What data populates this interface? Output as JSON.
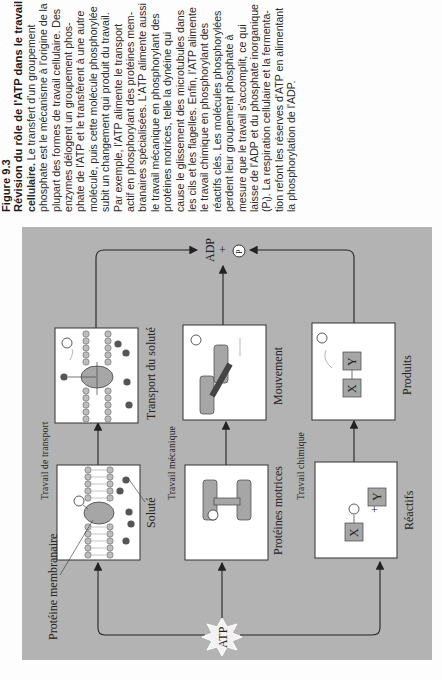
{
  "figure": {
    "number": "Figure 9.3",
    "title_lines": [
      "Révision du rôle de l'ATP dans le travail",
      "cellulaire."
    ],
    "caption_lines": [
      "Figure 9.3",
      "Révision du rôle de l'ATP dans le travail",
      "cellulaire. Le transfert d'un groupement",
      "phosphate est le mécanisme à l'origine de la",
      "plupart des formes de travail cellulaire. Des",
      "enzymes délogent un groupement phos-",
      "phate de l'ATP et le transfèrent à une autre",
      "molécule, puis cette molécule phosphorylée",
      "subit un changement qui produit du travail.",
      "Par exemple, l'ATP alimente le transport",
      "actif en phosphorylant des protéines mem-",
      "branaires spécialisées. L'ATP alimente aussi",
      "le travail mécanique en phosphorylant des",
      "protéines motrices, telle la dynéine qui",
      "cause le glissement des microtubules dans",
      "les cils et les flagelles. Enfin, l'ATP alimente",
      "le travail chimique en phosphorylant des",
      "réactifs clés. Les molécules phosphorylées",
      "perdent leur groupement phosphate à",
      "mesure que le travail s'accomplit, ce qui",
      "laisse de l'ADP et du phosphate inorganique",
      "(Pᵢ). La respiration cellulaire et la fermenta-",
      "tion refont les réserves d'ATP en alimentant",
      "la phosphorylation de l'ADP."
    ]
  },
  "diagram": {
    "colors": {
      "panel": "#b3b3b3",
      "box": "#ffffff",
      "protein": "#a6a6a6",
      "solute": "#555555",
      "lipid": "#bdbdbd"
    },
    "start": "ATP",
    "end": {
      "adp": "ADP",
      "plus": "+",
      "pi": "P",
      "pi_sub": "i"
    },
    "rows": [
      {
        "header": "Travail de transport",
        "before": {
          "label": "",
          "callouts": [
            "Protéine membranaire",
            "Soluté"
          ],
          "phosphate": "P"
        },
        "after": {
          "label": "Transport du soluté",
          "phosphate": "P",
          "phosphate_sub": "i"
        }
      },
      {
        "header": "Travail mécanique",
        "before": {
          "label": "Protéines motrices",
          "phosphate": "P"
        },
        "after": {
          "label": "Mouvement",
          "phosphate": "P",
          "phosphate_sub": "i"
        }
      },
      {
        "header": "Travail chimique",
        "before": {
          "label": "Réactifs",
          "x": "X",
          "y": "Y",
          "plus": "+",
          "phosphate": "P"
        },
        "after": {
          "label": "Produits",
          "x": "X",
          "y": "Y",
          "phosphate": "P",
          "phosphate_sub": "i"
        }
      }
    ]
  }
}
